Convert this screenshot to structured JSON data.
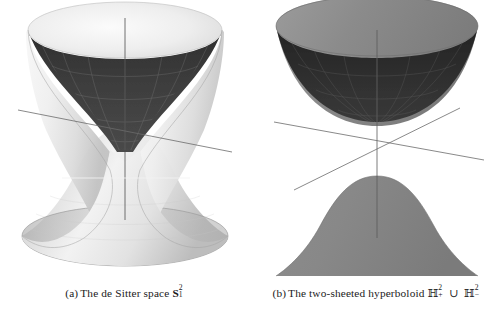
{
  "page": {
    "width": 503,
    "height": 316,
    "background": "#ffffff"
  },
  "figure": {
    "name": "hyperboloid-figure-pair",
    "subfigures": [
      {
        "id": "a",
        "label": "(a)",
        "caption_text": "The de Sitter space",
        "symbol": {
          "base": "S",
          "superscript": "2",
          "subscript": "1",
          "style": "bold"
        },
        "caption_full": "(a) The de Sitter space S²₁",
        "surface": {
          "type": "one-sheeted-hyperboloid",
          "outer_color": "#ececec",
          "inner_color": "#3a3a3a",
          "shade_light": "#fafafa",
          "shade_dark": "#9a9a9a",
          "grid_color": "#b9b9b9",
          "axis_color": "#4a4a4a"
        }
      },
      {
        "id": "b",
        "label": "(b)",
        "caption_text": "The two-sheeted hyperboloid",
        "symbol_left": {
          "base": "ℍ",
          "superscript": "2",
          "subscript": "+"
        },
        "union": "∪",
        "symbol_right": {
          "base": "ℍ",
          "superscript": "2",
          "subscript": "−"
        },
        "caption_full": "(b) The two-sheeted hyperboloid ℍ²₊ ∪ ℍ²₋",
        "surface": {
          "type": "two-sheeted-hyperboloid",
          "outer_color": "#878787",
          "inner_color": "#2b2b2b",
          "shade_light": "#9e9e9e",
          "shade_dark": "#6a6a6a",
          "grid_color": "#555555",
          "axis_color": "#4a4a4a"
        }
      }
    ]
  }
}
